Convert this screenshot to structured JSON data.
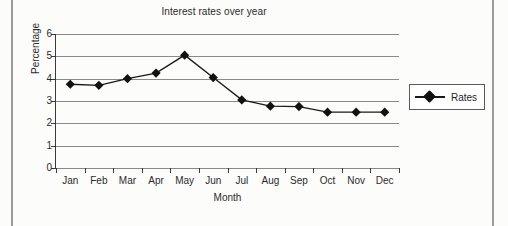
{
  "chart_data": {
    "type": "line",
    "title": "Interest rates over year",
    "xlabel": "Month",
    "ylabel": "Percentage",
    "categories": [
      "Jan",
      "Feb",
      "Mar",
      "Apr",
      "May",
      "Jun",
      "Jul",
      "Aug",
      "Sep",
      "Oct",
      "Nov",
      "Dec"
    ],
    "series": [
      {
        "name": "Rates",
        "values": [
          3.75,
          3.7,
          4.0,
          4.25,
          5.05,
          4.05,
          3.05,
          2.77,
          2.75,
          2.5,
          2.5,
          2.5
        ]
      }
    ],
    "ylim": [
      0,
      6
    ],
    "yticks": [
      0,
      1,
      2,
      3,
      4,
      5,
      6
    ],
    "ytick_labels": [
      "0",
      "1",
      "2",
      "3",
      "4",
      "5",
      "6"
    ],
    "grid": true,
    "legend_position": "right",
    "marker": "diamond",
    "line_color": "#1a1a1a",
    "marker_color": "#111111",
    "grid_color": "#8a8a8a"
  },
  "legend": {
    "entries": [
      {
        "label": "Rates"
      }
    ]
  }
}
